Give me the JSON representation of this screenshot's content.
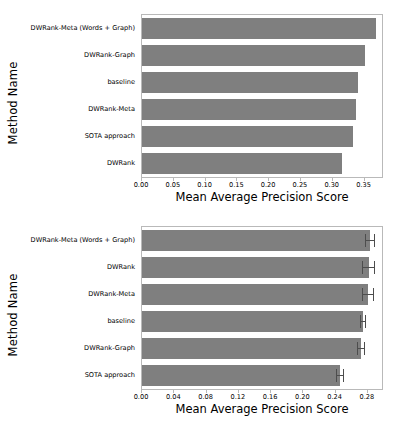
{
  "chart_data": [
    {
      "type": "bar",
      "orientation": "horizontal",
      "panel": "top",
      "title": "",
      "xlabel": "Mean Average Precision Score",
      "ylabel": "Method Name",
      "xlim": [
        0.0,
        0.3775
      ],
      "xticks": [
        "0.00",
        "0.05",
        "0.10",
        "0.15",
        "0.20",
        "0.25",
        "0.30",
        "0.35"
      ],
      "xtick_values": [
        0.0,
        0.05,
        0.1,
        0.15,
        0.2,
        0.25,
        0.3,
        0.35
      ],
      "grid": false,
      "legend": false,
      "bar_color": "#7f7f7f",
      "categories": [
        "DWRank-Meta (Words + Graph)",
        "DWRank-Graph",
        "baseline",
        "DWRank-Meta",
        "SOTA approach",
        "DWRank"
      ],
      "values": [
        0.368,
        0.35,
        0.339,
        0.337,
        0.332,
        0.315
      ],
      "errors": null
    },
    {
      "type": "bar",
      "orientation": "horizontal",
      "panel": "bottom",
      "title": "",
      "xlabel": "Mean Average Precision Score",
      "ylabel": "Method Name",
      "xlim": [
        0.0,
        0.2975
      ],
      "xticks": [
        "0.00",
        "0.04",
        "0.08",
        "0.12",
        "0.16",
        "0.20",
        "0.24",
        "0.28"
      ],
      "xtick_values": [
        0.0,
        0.04,
        0.08,
        0.12,
        0.16,
        0.2,
        0.24,
        0.28
      ],
      "grid": false,
      "legend": false,
      "bar_color": "#7f7f7f",
      "error_color": "#4d4d4d",
      "categories": [
        "DWRank-Meta (Words + Graph)",
        "DWRank",
        "DWRank-Meta",
        "baseline",
        "DWRank-Graph",
        "SOTA approach"
      ],
      "values": [
        0.283,
        0.281,
        0.28,
        0.274,
        0.271,
        0.246
      ],
      "errors": [
        0.006,
        0.008,
        0.007,
        0.004,
        0.005,
        0.005
      ]
    }
  ]
}
